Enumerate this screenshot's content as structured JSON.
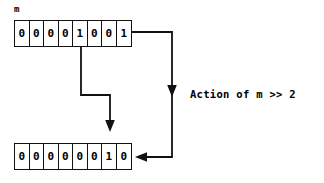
{
  "canvas": {
    "width": 324,
    "height": 183,
    "background": "#ffffff",
    "stroke_color": "#111111",
    "text_color": "#000000"
  },
  "labels": {
    "variable_name": "m",
    "action_caption": "Action of m >> 2"
  },
  "chart_data": {
    "type": "diagram",
    "title": "Action of m >> 2",
    "arrays": [
      {
        "name": "m",
        "label": "m",
        "role": "input",
        "bit_width": 8,
        "bits": [
          "0",
          "0",
          "0",
          "0",
          "1",
          "0",
          "0",
          "1"
        ],
        "value_binary": "00001001",
        "value_decimal": 9
      },
      {
        "name": "m_shifted",
        "label": "",
        "role": "output",
        "bit_width": 8,
        "bits": [
          "0",
          "0",
          "0",
          "0",
          "0",
          "0",
          "1",
          "0"
        ],
        "value_binary": "00000010",
        "value_decimal": 2
      }
    ],
    "operation": {
      "operator": ">>",
      "operand": 2,
      "expression": "m >> 2"
    },
    "connectors": [
      {
        "name": "inner-shift-arrow",
        "from": "input-bit-index-4",
        "to": "output-bit-index-6",
        "path": "down-right-down",
        "arrowhead": "end-down"
      },
      {
        "name": "outer-flow-arrow",
        "from": "input-array-right-edge",
        "to": "output-array-right-edge",
        "path": "right-down-left",
        "arrowheads": [
          "mid-down",
          "end-left"
        ]
      }
    ]
  }
}
